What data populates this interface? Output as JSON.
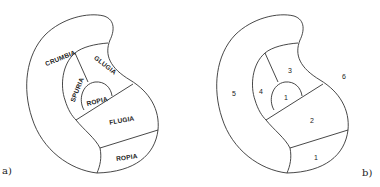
{
  "panels": [
    {
      "id": "a",
      "caption": "a)",
      "regions": [
        {
          "name": "crumbia",
          "label": "CRUMBIA"
        },
        {
          "name": "glugia",
          "label": "GLUGIA"
        },
        {
          "name": "spuria",
          "label": "SPURIA"
        },
        {
          "name": "ropia-inner",
          "label": "ROPIA"
        },
        {
          "name": "flugia",
          "label": "FLUGIA"
        },
        {
          "name": "ropia-outer",
          "label": "ROPIA"
        }
      ]
    },
    {
      "id": "b",
      "caption": "b)",
      "regions": [
        {
          "name": "region-5",
          "label": "5"
        },
        {
          "name": "region-3",
          "label": "3"
        },
        {
          "name": "region-4",
          "label": "4"
        },
        {
          "name": "region-1-inner",
          "label": "1"
        },
        {
          "name": "region-2",
          "label": "2"
        },
        {
          "name": "region-1-outer",
          "label": "1"
        },
        {
          "name": "region-6-outside",
          "label": "6"
        }
      ]
    }
  ],
  "colors": {
    "stroke": "#333333",
    "text": "#222222",
    "background": "#ffffff"
  }
}
